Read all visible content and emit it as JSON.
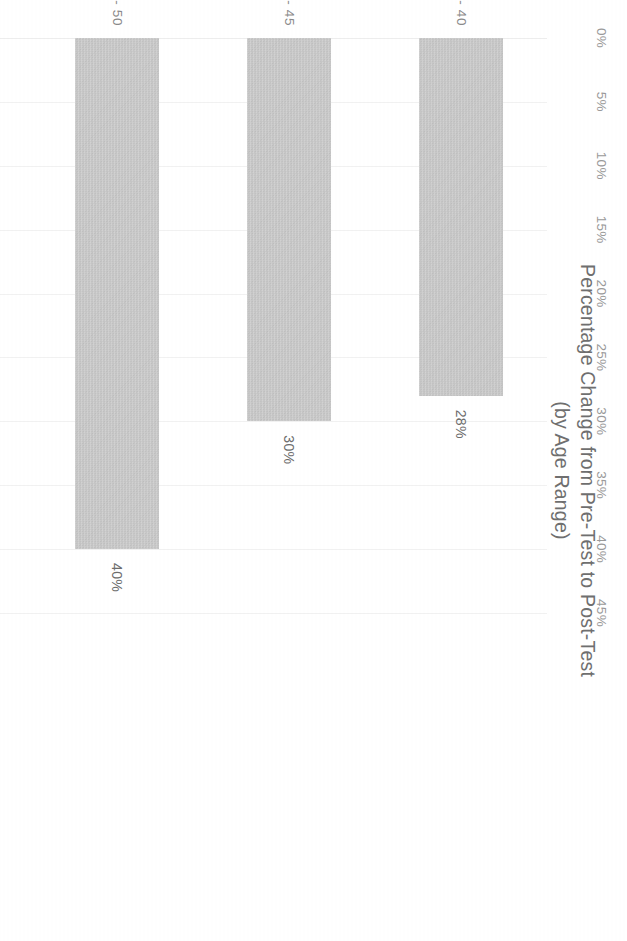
{
  "chart_data": {
    "type": "bar",
    "orientation": "horizontal",
    "title": "Percentage Change from Pre-Test to Post-Test",
    "subtitle": "(by Age Range)",
    "xlabel": "",
    "ylabel": "",
    "categories": [
      "36 - 40",
      "41 - 45",
      "46 - 50",
      "51 - 55",
      "56 - 60"
    ],
    "values": [
      28,
      30,
      40,
      10,
      0
    ],
    "data_labels": [
      "28%",
      "30%",
      "40%",
      "10%",
      "0%"
    ],
    "tick_labels": [
      "0%",
      "5%",
      "10%",
      "15%",
      "20%",
      "25%",
      "30%",
      "35%",
      "40%",
      "45%"
    ],
    "tick_values": [
      0,
      5,
      10,
      15,
      20,
      25,
      30,
      35,
      40,
      45
    ],
    "xlim": [
      0,
      45
    ],
    "grid": true,
    "legend": false,
    "bar_color": "#c9c9c9",
    "title_color": "#6f6f6f",
    "tick_label_color": "#9a9a9a",
    "category_label_color": "#8a8a8a",
    "value_label_color": "#6d6d6d",
    "background_color": "#ffffff"
  }
}
